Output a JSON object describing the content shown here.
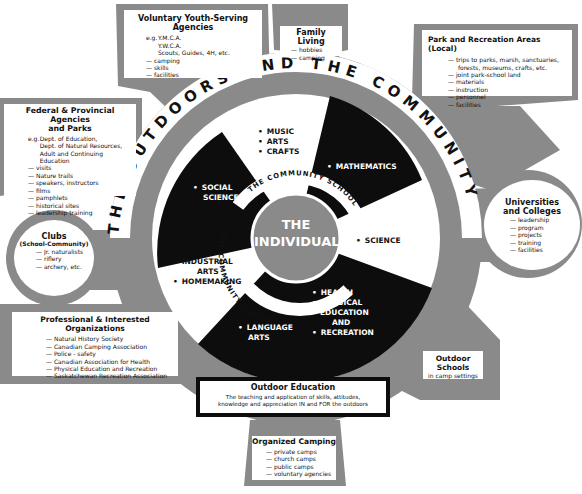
{
  "colors": {
    "background": "#ffffff",
    "panel_gray": "#8c8c8c",
    "dark_gray": "#6f6f6f",
    "black": "#0d0d0d",
    "inner_circle": "#8a8a8a",
    "white": "#ffffff"
  },
  "outer_banner": {
    "words": [
      "THE",
      "OUTDOORS",
      "AND",
      "THE",
      "COMMUNITY"
    ],
    "text": "THE OUTDOORS AND THE COMMUNITY"
  },
  "center": {
    "title_line1": "THE",
    "title_line2": "INDIVIDUAL"
  },
  "community_school_labels": {
    "upper": "THE COMMUNITY SCHOOL",
    "lower": "THE COMMUNITY SCHOOL"
  },
  "subjects": [
    {
      "id": "music",
      "items": [
        "MUSIC",
        "ARTS",
        "CRAFTS"
      ],
      "fill": "white"
    },
    {
      "id": "mathematics",
      "items": [
        "MATHEMATICS"
      ],
      "fill": "black"
    },
    {
      "id": "science",
      "items": [
        "SCIENCE"
      ],
      "fill": "white"
    },
    {
      "id": "health",
      "items": [
        "HEALTH",
        "PHYSICAL EDUCATION AND",
        "RECREATION"
      ],
      "fill": "black"
    },
    {
      "id": "language",
      "items": [
        "LANGUAGE ARTS"
      ],
      "fill": "black"
    },
    {
      "id": "industrial",
      "items": [
        "INDUSTRIAL ARTS",
        "HOMEMAKING"
      ],
      "fill": "white"
    },
    {
      "id": "social",
      "items": [
        "SOCIAL SCIENCE"
      ],
      "fill": "black"
    }
  ],
  "subject_text": {
    "music": "MUSIC",
    "arts": "ARTS",
    "crafts": "CRAFTS",
    "mathematics": "MATHEMATICS",
    "science": "SCIENCE",
    "health": "HEALTH",
    "physical_1": "PHYSICAL",
    "physical_2": "EDUCATION",
    "physical_3": "AND",
    "recreation": "RECREATION",
    "language_1": "LANGUAGE",
    "language_2": "ARTS",
    "industrial_1": "INDUSTRIAL",
    "industrial_2": "ARTS",
    "homemaking": "HOMEMAKING",
    "social_1": "SOCIAL",
    "social_2": "SCIENCE"
  },
  "boxes": {
    "voluntary": {
      "title_1": "Voluntary Youth-Serving",
      "title_2": "Agencies",
      "eg_prefix": "e.g.",
      "examples": [
        "Y.M.C.A.",
        "Y.W.C.A.",
        "Scouts, Guides, 4H, etc."
      ],
      "items": [
        "camping",
        "skills",
        "facilities"
      ]
    },
    "family": {
      "title": "Family Living",
      "items": [
        "hobbies",
        "camping"
      ]
    },
    "park": {
      "title": "Park and Recreation Areas (Local)",
      "items": [
        "trips to parks, marsh, sanctuaries,",
        "joint park-school land",
        "materials",
        "instruction",
        "personnel",
        "facilities"
      ],
      "item_continuation": "forests, museums, crafts, etc."
    },
    "federal": {
      "title_1": "Federal & Provincial Agencies",
      "title_2": "and Parks",
      "eg_prefix": "e.g.",
      "examples": [
        "Dept. of Education,",
        "Dept. of Natural Resources,",
        "Adult and Continuing Education"
      ],
      "items": [
        "visits",
        "Nature trails",
        "speakers, instructors",
        "films",
        "pamphlets",
        "historical sites",
        "leadership training"
      ]
    },
    "clubs": {
      "title": "Clubs",
      "subtitle": "(School-Community)",
      "items": [
        "Jr. naturalists",
        "riflery",
        "archery, etc."
      ]
    },
    "universities": {
      "title_1": "Universities",
      "title_2": "and Colleges",
      "items": [
        "leadership",
        "program",
        "projects",
        "training",
        "facilities"
      ]
    },
    "professional": {
      "title": "Professional & Interested Organizations",
      "items": [
        "Natural History Society",
        "Canadian Camping Association",
        "Police - safety",
        "Canadian Association for Health",
        "Physical Education and Recreation",
        "Saskatchewan Recreation Association"
      ]
    },
    "outdoor_schools": {
      "title": "Outdoor Schools",
      "subtitle": "in camp settings"
    },
    "outdoor_education": {
      "title": "Outdoor Education",
      "line_1": "The teaching and application of skills, attitudes,",
      "line_2": "knowledge and appreciation IN and FOR the outdoors"
    },
    "organized_camping": {
      "title": "Organized Camping",
      "items": [
        "private camps",
        "church camps",
        "public camps",
        "voluntary agencies"
      ]
    }
  }
}
